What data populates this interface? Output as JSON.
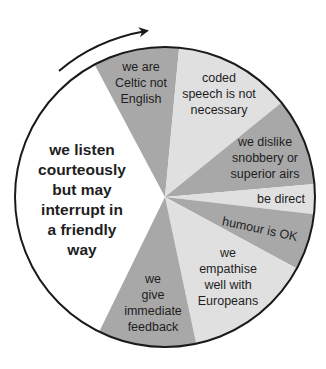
{
  "diagram": {
    "type": "segmented-wheel",
    "direction_arrow": "clockwise",
    "colors": {
      "dark": "#a8a8a8",
      "light": "#e0e0e0",
      "highlight": "#ffffff",
      "outline": "#1a1a1a"
    },
    "segments": [
      {
        "id": "listen",
        "lines": [
          "we listen",
          "courteously",
          "but may",
          "interrupt in",
          "a friendly",
          "way"
        ],
        "shade": "highlight"
      },
      {
        "id": "celtic",
        "lines": [
          "we are",
          "Celtic not",
          "English"
        ],
        "shade": "dark"
      },
      {
        "id": "coded",
        "lines": [
          "coded",
          "speech is not",
          "necessary"
        ],
        "shade": "light"
      },
      {
        "id": "snobbery",
        "lines": [
          "we dislike",
          "snobbery or",
          "superior airs"
        ],
        "shade": "dark"
      },
      {
        "id": "direct",
        "lines": [
          "be direct"
        ],
        "shade": "light"
      },
      {
        "id": "humour",
        "lines": [
          "humour is OK"
        ],
        "shade": "dark"
      },
      {
        "id": "empathise",
        "lines": [
          "we",
          "empathise",
          "well with",
          "Europeans"
        ],
        "shade": "light"
      },
      {
        "id": "feedback",
        "lines": [
          "we",
          "give",
          "immediate",
          "feedback"
        ],
        "shade": "dark"
      }
    ]
  }
}
